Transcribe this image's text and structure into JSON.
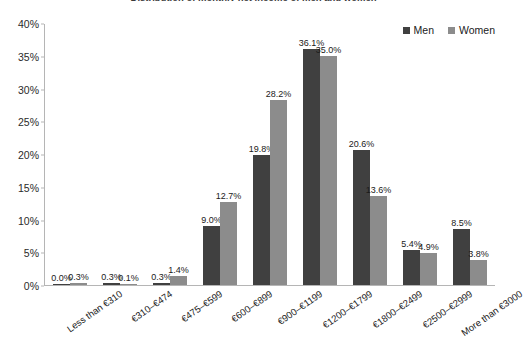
{
  "chart_data": {
    "type": "bar",
    "title": "Distribution of monthly net income of men and women",
    "xlabel": "",
    "ylabel": "",
    "ylim": [
      0,
      40
    ],
    "ytick_labels": [
      "0%",
      "5%",
      "10%",
      "15%",
      "20%",
      "25%",
      "30%",
      "35%",
      "40%"
    ],
    "ytick_values": [
      0,
      5,
      10,
      15,
      20,
      25,
      30,
      35,
      40
    ],
    "grid": false,
    "legend_position": "top-right",
    "categories": [
      "Less than €310",
      "€310–€474",
      "€475–€599",
      "€600–€899",
      "€900–€1199",
      "€1200–€1799",
      "€1800–€2499",
      "€2500–€2999",
      "More than €3000"
    ],
    "series": [
      {
        "name": "Men",
        "color": "#404040",
        "values": [
          0.0,
          0.3,
          0.3,
          9.0,
          19.8,
          36.1,
          20.6,
          5.4,
          8.5
        ],
        "labels": [
          "0.0%",
          "0.3%",
          "0.3%",
          "9.0%",
          "19.8%",
          "36.1%",
          "20.6%",
          "5.4%",
          "8.5%"
        ]
      },
      {
        "name": "Women",
        "color": "#8c8c8c",
        "values": [
          0.3,
          0.1,
          1.4,
          12.7,
          28.2,
          35.0,
          13.6,
          4.9,
          3.8
        ],
        "labels": [
          "0.3%",
          "0.1%",
          "1.4%",
          "12.7%",
          "28.2%",
          "35.0%",
          "13.6%",
          "4.9%",
          "3.8%"
        ]
      }
    ]
  },
  "legend": {
    "entries": [
      {
        "label": "Men",
        "color": "#404040"
      },
      {
        "label": "Women",
        "color": "#8c8c8c"
      }
    ]
  }
}
